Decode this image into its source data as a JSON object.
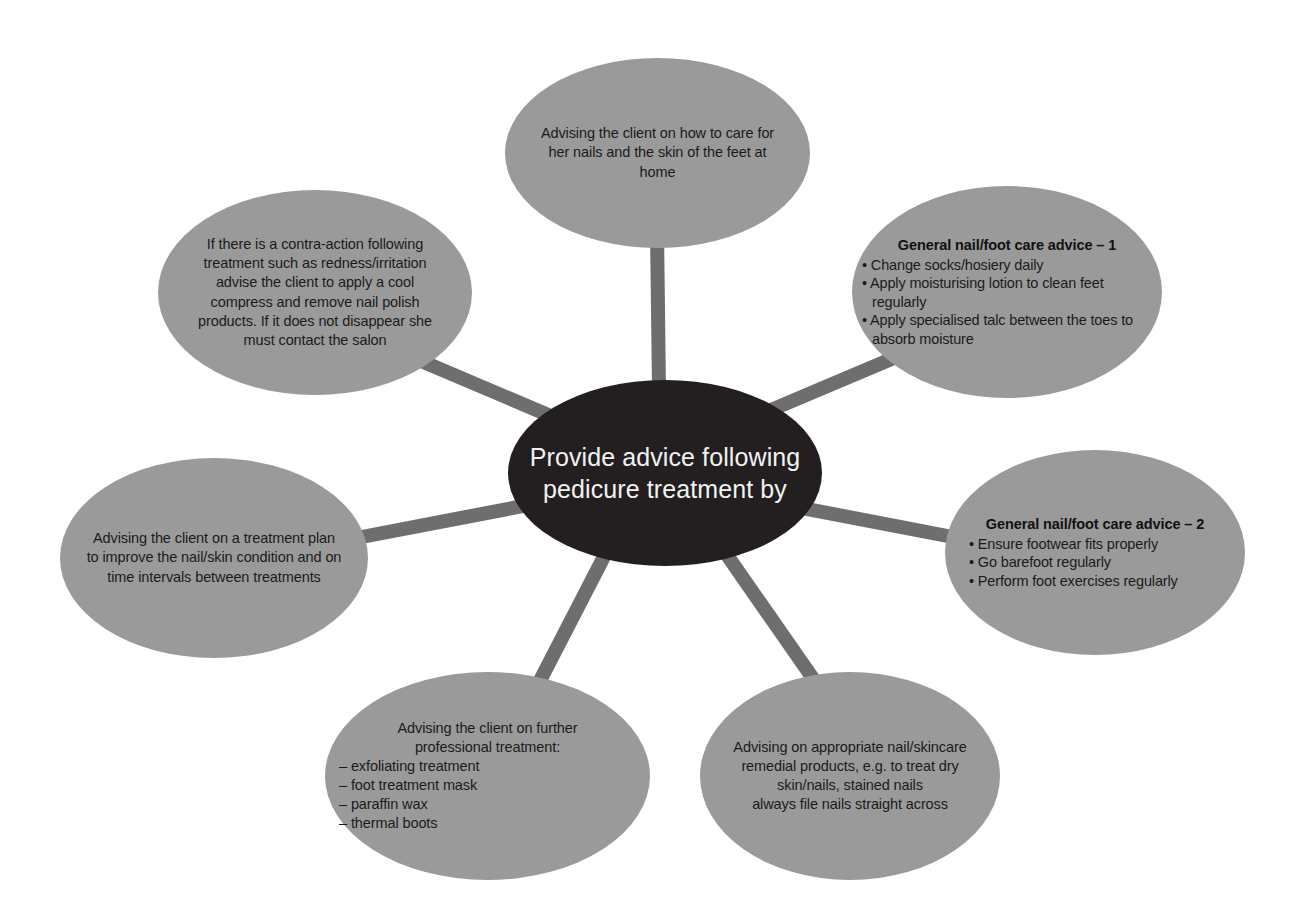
{
  "diagram": {
    "title": "Provide advice following pedicure treatment by",
    "type": "hub-and-spoke",
    "colors": {
      "hub_fill": "#231f20",
      "hub_text": "#f2f2f2",
      "node_fill": "#9a9a9a",
      "node_text": "#1a1a1a",
      "spoke": "#6e6e6e",
      "background": "#ffffff"
    },
    "center": {
      "label": "Provide advice following\npedicure treatment by"
    },
    "nodes": [
      {
        "id": "home-care",
        "name": "home-care-node",
        "text": "Advising the client on how to care for\nher nails and the skin of the feet at\nhome"
      },
      {
        "id": "general-advice-1",
        "name": "general-advice-1-node",
        "heading": "General nail/foot care advice – 1",
        "bullets": [
          "Change socks/hosiery daily",
          "Apply moisturising lotion to clean feet regularly",
          "Apply specialised talc between the toes to absorb moisture"
        ]
      },
      {
        "id": "general-advice-2",
        "name": "general-advice-2-node",
        "heading": "General nail/foot care advice – 2",
        "bullets": [
          "Ensure footwear fits properly",
          "Go barefoot regularly",
          "Perform foot exercises regularly"
        ]
      },
      {
        "id": "remedial-products",
        "name": "remedial-products-node",
        "text": "Advising on appropriate nail/skincare\nremedial products, e.g. to treat dry\nskin/nails, stained nails\nalways file nails straight across"
      },
      {
        "id": "further-treatment",
        "name": "further-treatment-node",
        "intro": "Advising the client on further\nprofessional treatment:",
        "items": [
          "– exfoliating treatment",
          "– foot treatment mask",
          "– paraffin wax",
          "– thermal boots"
        ]
      },
      {
        "id": "treatment-plan",
        "name": "treatment-plan-node",
        "text": "Advising the client on a treatment plan\nto improve the nail/skin condition and on\ntime intervals between treatments"
      },
      {
        "id": "contra-action",
        "name": "contra-action-node",
        "text": "If there is a contra-action following\ntreatment such as redness/irritation\nadvise the client to apply a cool\ncompress and remove nail polish\nproducts. If it does not disappear she\nmust contact the salon"
      }
    ]
  }
}
